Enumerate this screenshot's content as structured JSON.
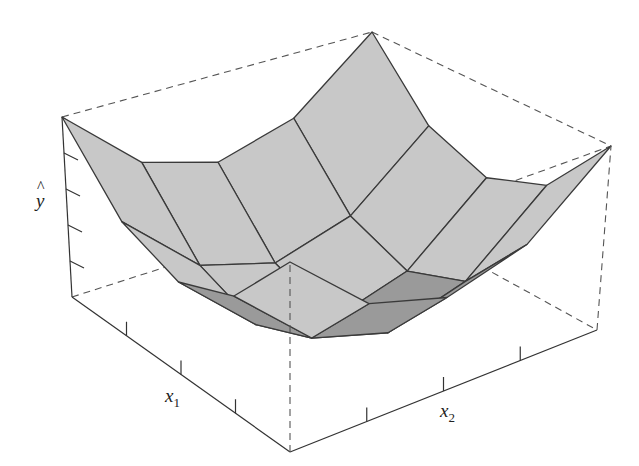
{
  "chart_data": {
    "type": "surface3d",
    "title": "",
    "xlabel": "x1",
    "ylabel": "x2",
    "zlabel": "ŷ",
    "axis_labels": {
      "x1": {
        "base": "x",
        "sub": "1"
      },
      "x2": {
        "base": "x",
        "sub": "2"
      },
      "yhat": {
        "base": "y",
        "hat": "^"
      }
    },
    "grid_size": [
      5,
      5
    ],
    "x1": [
      0,
      1,
      2,
      3,
      4
    ],
    "x2": [
      0,
      1,
      2,
      3,
      4
    ],
    "z": [
      [
        1.0,
        0.625,
        0.5,
        0.625,
        1.0
      ],
      [
        0.625,
        0.25,
        0.125,
        0.25,
        0.625
      ],
      [
        0.5,
        0.125,
        0.0,
        0.125,
        0.5
      ],
      [
        0.625,
        0.25,
        0.125,
        0.25,
        0.625
      ],
      [
        1.0,
        0.625,
        0.5,
        0.625,
        1.0
      ]
    ],
    "z_ticks_count": 4,
    "x1_ticks_count": 3,
    "x2_ticks_count": 3,
    "box": "dashed bounding box",
    "surface_color": "#c8c8c8",
    "surface_dark_color": "#9a9a9a",
    "edge_color": "#3a3a3a"
  }
}
